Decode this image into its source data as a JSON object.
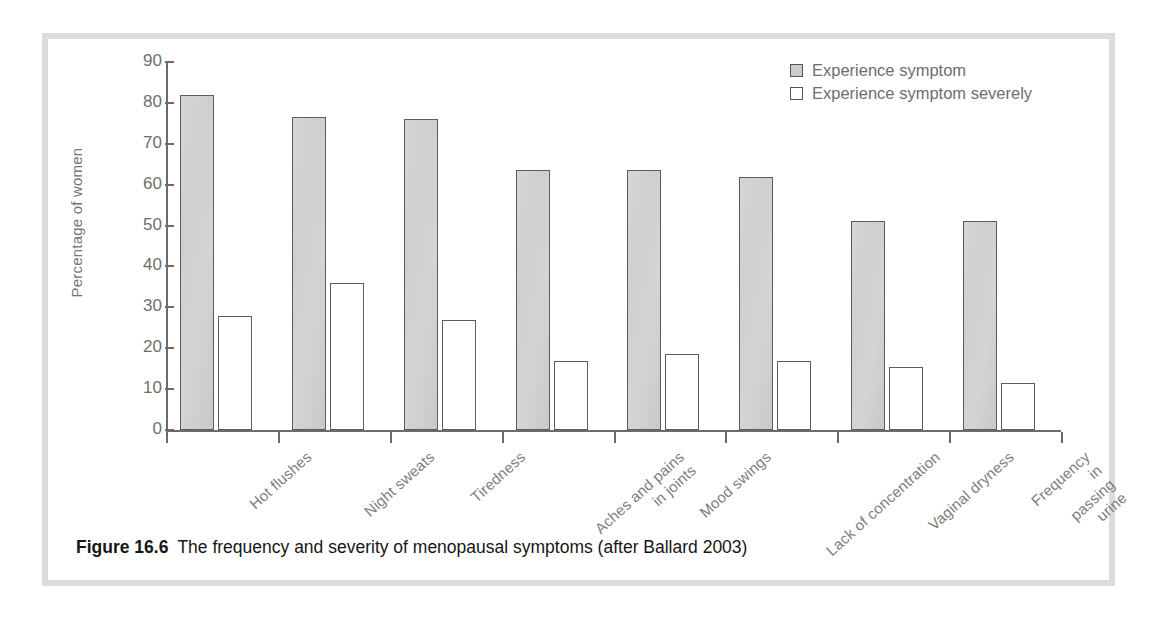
{
  "figure": {
    "caption_number": "Figure 16.6",
    "caption_text": "The frequency and severity of menopausal symptoms (after Ballard 2003)"
  },
  "legend": {
    "position": "top-right",
    "entries": [
      {
        "label": "Experience symptom",
        "style": "filled",
        "color": "#cccccc"
      },
      {
        "label": "Experience symptom severely",
        "style": "hollow",
        "color": "#ffffff"
      }
    ]
  },
  "axes": {
    "y_title": "Percentage of women",
    "y_ticks": [
      90,
      80,
      70,
      60,
      50,
      40,
      30,
      20,
      10,
      0
    ],
    "y_min": 0,
    "y_max": 90
  },
  "chart_data": {
    "type": "bar",
    "title": "The frequency and severity of menopausal symptoms (after Ballard 2003)",
    "xlabel": "",
    "ylabel": "Percentage of women",
    "ylim": [
      0,
      90
    ],
    "ytick_step": 10,
    "grid": false,
    "legend_position": "top-right",
    "categories": [
      "Hot flushes",
      "Night sweats",
      "Tiredness",
      "Aches and pains\nin joints",
      "Mood swings",
      "Lack of concentration",
      "Vaginal dryness",
      "Frequency in\npassing urine"
    ],
    "series": [
      {
        "name": "Experience symptom",
        "values": [
          82,
          76.5,
          76,
          63.5,
          63.5,
          62,
          51,
          51
        ]
      },
      {
        "name": "Experience symptom severely",
        "values": [
          28,
          36,
          27,
          17,
          18.5,
          17,
          15.5,
          11.5
        ]
      }
    ]
  },
  "colors": {
    "bar_fill": "#d2d2d2",
    "bar_stroke": "#5d5d5d",
    "axis": "#6b6b6b",
    "label_text": "#7d7d7d",
    "frame": "#dcdcdc",
    "caption_text": "#161616"
  }
}
